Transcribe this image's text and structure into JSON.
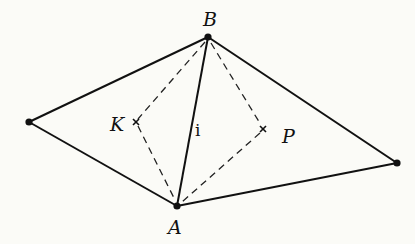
{
  "diagram": {
    "points": {
      "B": {
        "label": "B",
        "x": 208,
        "y": 37
      },
      "A": {
        "label": "A",
        "x": 177,
        "y": 206
      },
      "L": {
        "label": "",
        "x": 29,
        "y": 122
      },
      "R": {
        "label": "",
        "x": 397,
        "y": 163
      },
      "K": {
        "label": "K",
        "x": 136,
        "y": 122
      },
      "P": {
        "label": "P",
        "x": 263,
        "y": 129
      }
    },
    "edge_label": "i",
    "labels": {
      "B": "B",
      "A": "A",
      "K": "K",
      "P": "P",
      "i": "i"
    },
    "solid_edges": [
      [
        "L",
        "B"
      ],
      [
        "L",
        "A"
      ],
      [
        "B",
        "R"
      ],
      [
        "A",
        "R"
      ],
      [
        "A",
        "B"
      ]
    ],
    "dashed_edges": [
      [
        "B",
        "K"
      ],
      [
        "K",
        "A"
      ],
      [
        "B",
        "P"
      ],
      [
        "P",
        "A"
      ]
    ],
    "colors": {
      "ink": "#111111",
      "paper": "#fbfbf7"
    }
  }
}
